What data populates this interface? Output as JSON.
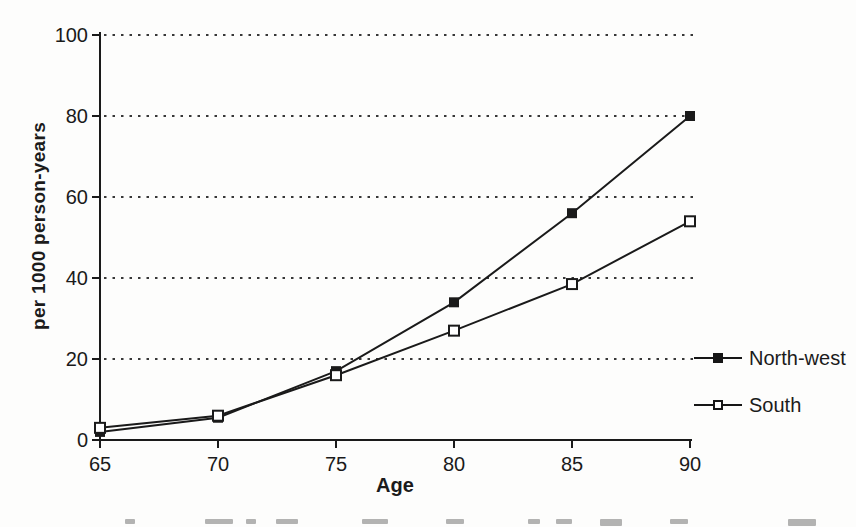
{
  "chart_data": {
    "type": "line",
    "x": [
      65,
      70,
      75,
      80,
      85,
      90
    ],
    "xlim": [
      65,
      90
    ],
    "ylim": [
      0,
      100
    ],
    "xticks": [
      65,
      70,
      75,
      80,
      85,
      90
    ],
    "yticks": [
      0,
      20,
      40,
      60,
      80,
      100
    ],
    "xlabel": "Age",
    "ylabel": "per 1000 person-years",
    "title": "",
    "grid": "horizontal-dotted-at-yticks",
    "legend_position": "right-outside",
    "line_color": "#1a1a1a",
    "series": [
      {
        "name": "North-west",
        "marker": "filled-square",
        "values": [
          2,
          5.5,
          17,
          34,
          56,
          80
        ]
      },
      {
        "name": "South",
        "marker": "open-square",
        "values": [
          3,
          6,
          16,
          27,
          38.5,
          54
        ]
      }
    ]
  }
}
